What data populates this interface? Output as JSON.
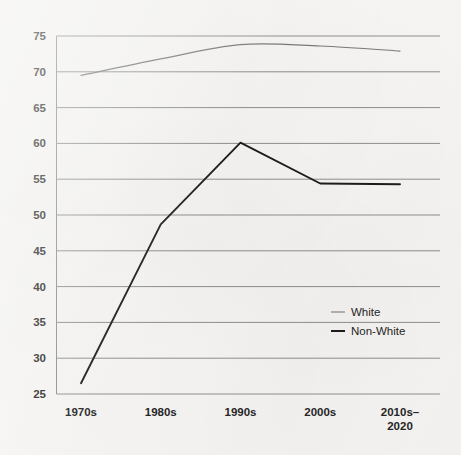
{
  "chart_data": {
    "type": "line",
    "title": "",
    "xlabel": "",
    "ylabel": "",
    "categories": [
      "1970s",
      "1980s",
      "1990s",
      "2000s",
      "2010s–\n2020"
    ],
    "category_labels": [
      {
        "line1": "1970s",
        "line2": ""
      },
      {
        "line1": "1980s",
        "line2": ""
      },
      {
        "line1": "1990s",
        "line2": ""
      },
      {
        "line1": "2000s",
        "line2": ""
      },
      {
        "line1": "2010s–",
        "line2": "2020"
      }
    ],
    "series": [
      {
        "name": "White",
        "values": [
          69.5,
          71.8,
          73.8,
          73.6,
          72.9
        ],
        "color": "#7a7a7a",
        "smooth": true
      },
      {
        "name": "Non-White",
        "values": [
          26.5,
          48.7,
          60.1,
          54.4,
          54.3
        ],
        "color": "#1c1c1c",
        "smooth": false
      }
    ],
    "ylim": [
      25,
      75
    ],
    "yticks": [
      25,
      30,
      35,
      40,
      45,
      50,
      55,
      60,
      65,
      70,
      75
    ],
    "ytick_labels": [
      "25",
      "30",
      "35",
      "40",
      "45",
      "50",
      "55",
      "60",
      "65",
      "70",
      "75"
    ],
    "grid": true,
    "grid_axis": "y",
    "grid_color": "#8e8e8e",
    "axis_color": "#8e8e8e",
    "background_color": "#f6f5f3",
    "legend": {
      "position": "inside-right-middle",
      "entries": [
        {
          "label": "White",
          "color": "#7a7a7a",
          "width": 1.1
        },
        {
          "label": "Non-White",
          "color": "#1c1c1c",
          "width": 2.0
        }
      ]
    }
  }
}
